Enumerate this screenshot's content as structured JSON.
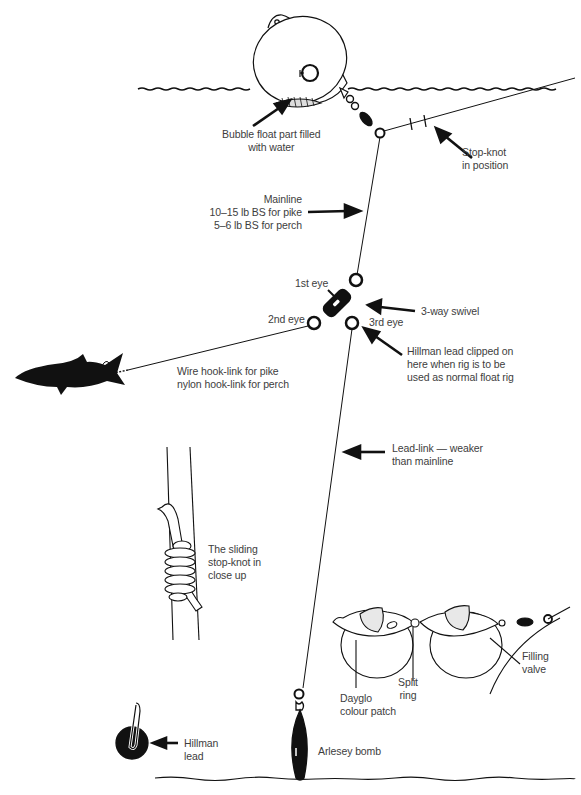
{
  "diagram": {
    "colors": {
      "ink": "#111111",
      "text": "#3d3d3d",
      "background": "#ffffff"
    },
    "labels": {
      "bubble_float": "Bubble float part filled\nwith water",
      "stop_knot": "Stop-knot\nin position",
      "mainline": "Mainline\n10–15 lb BS for pike\n5–6 lb BS for perch",
      "first_eye": "1st eye",
      "second_eye": "2nd eye",
      "third_eye": "3rd eye",
      "three_way_swivel": "3-way swivel",
      "hillman_clip": "Hillman lead clipped on\nhere when rig is to be\nused as normal float rig",
      "hook_link": "Wire hook-link for pike\nnylon hook-link for perch",
      "lead_link": "Lead-link — weaker\nthan mainline",
      "sliding_knot": "The sliding\nstop-knot in\nclose up",
      "dayglo": "Dayglo\ncolour patch",
      "split_ring": "Split\nring",
      "filling_valve": "Filling\nvalve",
      "hillman_lead": "Hillman\nlead",
      "arlesey_bomb": "Arlesey bomb"
    },
    "icons": [
      "bubble-float-icon",
      "swivel-icon",
      "three-way-swivel-icon",
      "fish-bait-icon",
      "stop-knot-icon",
      "double-bubble-float-icon",
      "hillman-lead-icon",
      "arlesey-bomb-icon",
      "arrow-icon"
    ]
  }
}
